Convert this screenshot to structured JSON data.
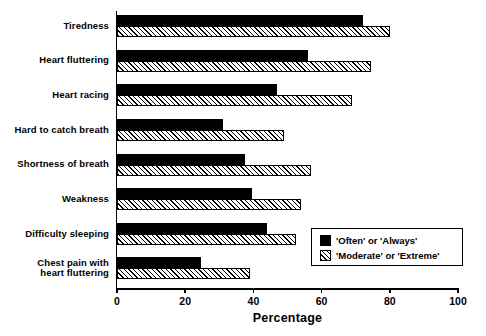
{
  "chart_data": {
    "type": "bar",
    "orientation": "horizontal",
    "title": "",
    "xlabel": "Percentage",
    "ylabel": "",
    "xlim": [
      0,
      100
    ],
    "xticks": [
      0,
      20,
      40,
      60,
      80,
      100
    ],
    "grid": false,
    "legend_position": "inside-bottom-right",
    "categories": [
      "Tiredness",
      "Heart fluttering",
      "Heart racing",
      "Hard to catch breath",
      "Shortness of breath",
      "Weakness",
      "Difficulty sleeping",
      "Chest pain with heart fluttering"
    ],
    "series": [
      {
        "name": "'Often' or 'Always'",
        "style": "solid-black",
        "values": [
          72,
          56,
          47,
          31,
          37.5,
          39.5,
          44,
          24.5
        ]
      },
      {
        "name": "'Moderate' or 'Extreme'",
        "style": "diagonal-hatch",
        "values": [
          80,
          74.5,
          69,
          49,
          57,
          54,
          52.5,
          39
        ]
      }
    ]
  },
  "axis": {
    "tick_labels": [
      "0",
      "20",
      "40",
      "60",
      "80",
      "100"
    ],
    "x_title": "Percentage"
  },
  "category_labels": [
    {
      "lines": [
        "Tiredness"
      ]
    },
    {
      "lines": [
        "Heart fluttering"
      ]
    },
    {
      "lines": [
        "Heart racing"
      ]
    },
    {
      "lines": [
        "Hard to catch breath"
      ]
    },
    {
      "lines": [
        "Shortness of breath"
      ]
    },
    {
      "lines": [
        "Weakness"
      ]
    },
    {
      "lines": [
        "Difficulty sleeping"
      ]
    },
    {
      "lines": [
        "Chest pain with",
        "heart fluttering"
      ]
    }
  ],
  "legend": {
    "entries": [
      {
        "label": "'Often' or 'Always'",
        "swatch": "solid-black-swatch"
      },
      {
        "label": "'Moderate' or 'Extreme'",
        "swatch": "hatched-swatch"
      }
    ]
  },
  "colors": {
    "series_1": "#000000",
    "series_2_hatch": "#000000",
    "series_2_background": "#ffffff",
    "axis": "#000000",
    "page_background": "#ffffff"
  }
}
